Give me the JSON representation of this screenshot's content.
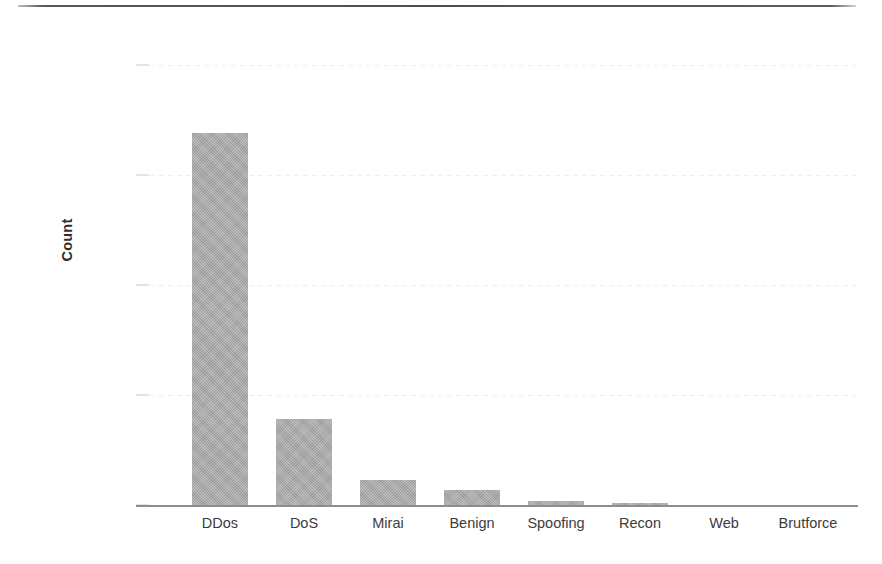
{
  "figure": {
    "ylabel": "Count",
    "top_rule": "page-scan-rule"
  },
  "chart_data": {
    "type": "bar",
    "title": "",
    "xlabel": "",
    "ylabel": "Count",
    "categories": [
      "DDos",
      "DoS",
      "Mirai",
      "Benign",
      "Spoofing",
      "Recon",
      "Web",
      "Brutforce"
    ],
    "values": [
      33800000,
      7800000,
      2300000,
      1400000,
      400000,
      200000,
      20000,
      10000
    ],
    "ylim": [
      0,
      42000000
    ],
    "yticks": [
      0,
      10000000,
      20000000,
      30000000,
      40000000
    ],
    "ytick_labels": [
      "0",
      "10000000",
      "20000000",
      "30000000",
      "40000000"
    ],
    "grid": true,
    "grid_axis": "y",
    "legend": false,
    "bar_color": "#a9a9a9"
  }
}
